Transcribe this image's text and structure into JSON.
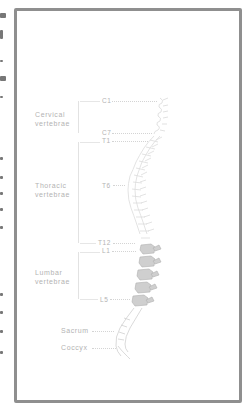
{
  "diagram": {
    "groups": [
      {
        "label_line1": "Cervical",
        "label_line2": "vertebrae",
        "start": "C1",
        "end": "C7"
      },
      {
        "label_line1": "Thoracic",
        "label_line2": "vertebrae",
        "start": "T1",
        "mid": "T6",
        "end": "T12"
      },
      {
        "label_line1": "Lumbar",
        "label_line2": "vertebrae",
        "start": "L1",
        "end": "L5"
      }
    ],
    "markers": {
      "c1": "C1",
      "c7": "C7",
      "t1": "T1",
      "t6": "T6",
      "t12": "T12",
      "l1": "L1",
      "l5": "L5"
    },
    "regions": {
      "sacrum": "Sacrum",
      "coccyx": "Coccyx"
    },
    "colors": {
      "frame": "#8f8f8f",
      "label": "#b3b3b3",
      "vertebra_light": "#e6e6e6",
      "vertebra_lumbar": "#c8c8c8"
    }
  }
}
